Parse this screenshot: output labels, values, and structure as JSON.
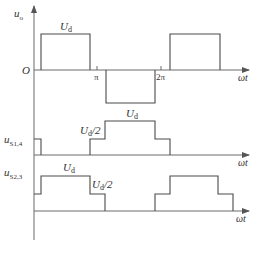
{
  "diagram": {
    "type": "waveform",
    "plots": [
      {
        "id": "uo",
        "ylabel_main": "u",
        "ylabel_sub": "o",
        "origin_label": "O",
        "level_label_main": "U",
        "level_label_sub": "d",
        "tick_pi": "π",
        "tick_2pi": "2π",
        "xlabel": "ωt"
      },
      {
        "id": "uS14",
        "ylabel_main": "u",
        "ylabel_sub": "S1,4",
        "level_full_main": "U",
        "level_full_sub": "d",
        "level_half_main": "U",
        "level_half_sub": "d",
        "level_half_suffix": "/2",
        "xlabel": "ωt"
      },
      {
        "id": "uS23",
        "ylabel_main": "u",
        "ylabel_sub": "S2,3",
        "level_full_main": "U",
        "level_full_sub": "d",
        "level_half_main": "U",
        "level_half_sub": "d",
        "level_half_suffix": "/2",
        "xlabel": "ωt"
      }
    ],
    "colors": {
      "line": "#4a4a4a",
      "axis": "#6b6b6b",
      "text": "#333333"
    }
  }
}
